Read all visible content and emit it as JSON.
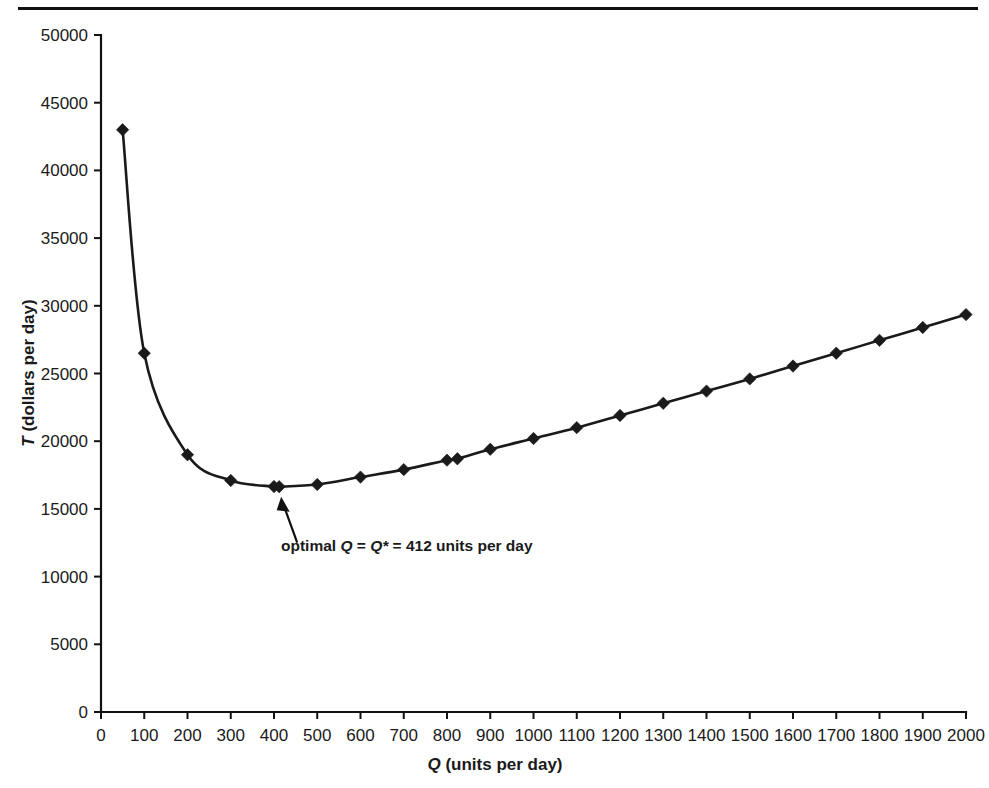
{
  "figure": {
    "page_rule": "horizontal-rule",
    "background_color": "#ffffff",
    "ink_color": "#1a1a1a"
  },
  "chart_data": {
    "type": "line",
    "title": "",
    "subtitle": "",
    "xlabel_plain": "Q (units per day)",
    "xlabel_italic_part": "Q",
    "xlabel_rest": " (units per day)",
    "ylabel_plain": "T (dollars per day)",
    "ylabel_italic_part": "T",
    "ylabel_rest": " (dollars per day)",
    "xlim": [
      0,
      2000
    ],
    "ylim": [
      0,
      50000
    ],
    "xtick_step": 100,
    "ytick_step": 5000,
    "grid": false,
    "legend": "none",
    "marker": "diamond",
    "xticks": [
      0,
      100,
      200,
      300,
      400,
      500,
      600,
      700,
      800,
      900,
      1000,
      1100,
      1200,
      1300,
      1400,
      1500,
      1600,
      1700,
      1800,
      1900,
      2000
    ],
    "yticks": [
      0,
      5000,
      10000,
      15000,
      20000,
      25000,
      30000,
      35000,
      40000,
      45000,
      50000
    ],
    "xtick_labels": [
      "0",
      "100",
      "200",
      "300",
      "400",
      "500",
      "600",
      "700",
      "800",
      "900",
      "1000",
      "1100",
      "1200",
      "1300",
      "1400",
      "1500",
      "1600",
      "1700",
      "1800",
      "1900",
      "2000"
    ],
    "ytick_labels": [
      "0",
      "5000",
      "10000",
      "15000",
      "20000",
      "25000",
      "30000",
      "35000",
      "40000",
      "45000",
      "50000"
    ],
    "series": [
      {
        "name": "T (total cost)",
        "x": [
          50,
          100,
          200,
          300,
          400,
          412,
          500,
          600,
          700,
          800,
          824,
          900,
          1000,
          1100,
          1200,
          1300,
          1400,
          1500,
          1600,
          1700,
          1800,
          1900,
          2000
        ],
        "y": [
          43000,
          26500,
          19000,
          17100,
          16650,
          16640,
          16800,
          17350,
          17900,
          18600,
          18700,
          19400,
          20200,
          21000,
          21900,
          22800,
          23700,
          24600,
          25550,
          26500,
          27450,
          28400,
          29350
        ]
      }
    ],
    "annotations": [
      {
        "name": "optimal-q-annotation",
        "text_prefix": "optimal ",
        "text_italic_1": "Q",
        "text_mid_1": " = ",
        "text_italic_2": "Q*",
        "text_suffix": " = 412 units per day",
        "full_text": "optimal Q = Q* = 412 units per day",
        "points_to_x": 412,
        "points_to_y": 16640
      }
    ]
  }
}
